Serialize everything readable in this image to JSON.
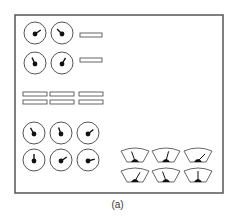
{
  "caption": "(a)",
  "colors": {
    "stroke": "#555555",
    "fill": "#111111",
    "background": "#ffffff"
  },
  "frame": {
    "x": 15,
    "y": 15,
    "w": 208,
    "h": 178
  },
  "dials_top": [
    {
      "cx": 35,
      "cy": 33,
      "angle": 55
    },
    {
      "cx": 62,
      "cy": 33,
      "angle": -45
    },
    {
      "cx": 35,
      "cy": 63,
      "angle": -25
    },
    {
      "cx": 62,
      "cy": 63,
      "angle": 30
    }
  ],
  "bars_side": [
    {
      "x": 80,
      "y": 33,
      "w": 22,
      "h": 4
    },
    {
      "x": 80,
      "y": 58,
      "w": 22,
      "h": 4
    }
  ],
  "bars_grid": [
    {
      "x": 23,
      "y": 92,
      "w": 24,
      "h": 4
    },
    {
      "x": 50,
      "y": 92,
      "w": 24,
      "h": 4
    },
    {
      "x": 79,
      "y": 92,
      "w": 24,
      "h": 4
    },
    {
      "x": 23,
      "y": 100,
      "w": 24,
      "h": 4
    },
    {
      "x": 50,
      "y": 100,
      "w": 24,
      "h": 4
    },
    {
      "x": 79,
      "y": 100,
      "w": 24,
      "h": 4
    }
  ],
  "dials_bottom": [
    {
      "cx": 34,
      "cy": 133,
      "angle": -30
    },
    {
      "cx": 61,
      "cy": 133,
      "angle": -20
    },
    {
      "cx": 88,
      "cy": 133,
      "angle": 50
    },
    {
      "cx": 34,
      "cy": 160,
      "angle": 0
    },
    {
      "cx": 61,
      "cy": 160,
      "angle": 55
    },
    {
      "cx": 88,
      "cy": 160,
      "angle": 75
    }
  ],
  "gauges": [
    {
      "x": 121,
      "y": 147,
      "angle": -20
    },
    {
      "x": 152,
      "y": 147,
      "angle": 15
    },
    {
      "x": 184,
      "y": 147,
      "angle": 45
    },
    {
      "x": 121,
      "y": 167,
      "angle": 30
    },
    {
      "x": 152,
      "y": 167,
      "angle": -20
    },
    {
      "x": 184,
      "y": 167,
      "angle": 0
    }
  ]
}
